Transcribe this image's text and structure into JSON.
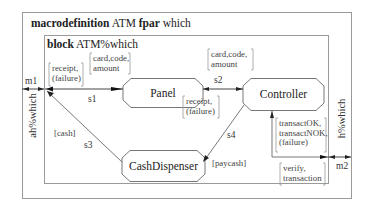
{
  "macro": {
    "keyword": "macrodefinition",
    "name": "ATM",
    "fpar_keyword": "fpar",
    "param": "which"
  },
  "block": {
    "keyword": "block",
    "name": "ATM%which"
  },
  "processes": {
    "panel": "Panel",
    "controller": "Controller",
    "cash_dispenser": "CashDispenser"
  },
  "gates": {
    "left": "ah%which",
    "right": "h%which"
  },
  "channels": {
    "m1": {
      "label": "m1",
      "signals_in": [
        "receipt,",
        "(failure)"
      ]
    },
    "s1": {
      "label": "s1",
      "signals_out": [
        "card,code,",
        "amount"
      ]
    },
    "s2": {
      "label": "s2",
      "signals_to_controller": [
        "card,code,",
        "amount"
      ],
      "signals_to_panel": [
        "receipt,",
        "(failure)"
      ]
    },
    "s3": {
      "label": "s3",
      "signals": [
        "[cash]"
      ]
    },
    "s4": {
      "label": "s4",
      "signals": [
        "[paycash]"
      ]
    },
    "m2": {
      "label": "m2",
      "signals_in": [
        "transactOK,",
        "transactNOK,",
        "(failure)"
      ],
      "signals_out": [
        "verify,",
        "transaction"
      ]
    }
  },
  "colors": {
    "frame": "#9a9a9a",
    "line": "#555555",
    "text": "#2a2a2a"
  }
}
